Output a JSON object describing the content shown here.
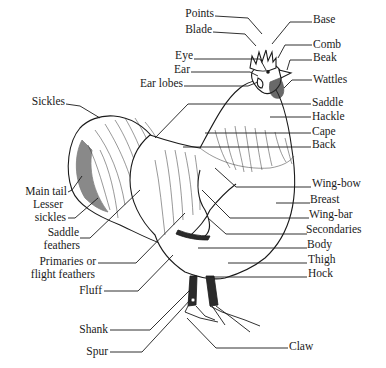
{
  "diagram": {
    "labels": {
      "points": "Points",
      "blade": "Blade",
      "eye": "Eye",
      "ear": "Ear",
      "ear_lobes": "Ear lobes",
      "sickles": "Sickles",
      "main_tail": "Main tail",
      "lesser_sickles_1": "Lesser",
      "lesser_sickles_2": "sickles",
      "saddle_feathers_1": "Saddle",
      "saddle_feathers_2": "feathers",
      "primaries_1": "Primaries or",
      "primaries_2": "flight feathers",
      "fluff": "Fluff",
      "shank": "Shank",
      "spur": "Spur",
      "base": "Base",
      "comb": "Comb",
      "beak": "Beak",
      "wattles": "Wattles",
      "saddle": "Saddle",
      "hackle": "Hackle",
      "cape": "Cape",
      "back": "Back",
      "wing_bow": "Wing-bow",
      "breast": "Breast",
      "wing_bar": "Wing-bar",
      "secondaries": "Secondaries",
      "body": "Body",
      "thigh": "Thigh",
      "hock": "Hock",
      "claw": "Claw"
    }
  }
}
